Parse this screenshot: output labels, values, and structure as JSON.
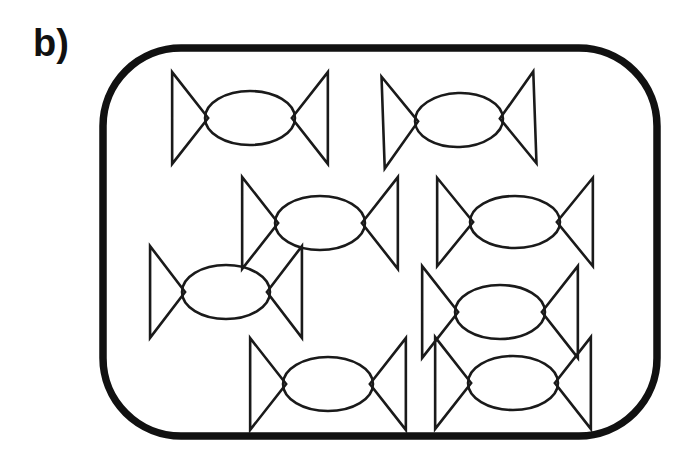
{
  "figure": {
    "panel_label": "b)",
    "background_color": "#ffffff",
    "ink_color": "#111111",
    "item_count": 8,
    "item_name": "candy",
    "container": {
      "name": "rounded-rectangle-enclosure",
      "x": 103,
      "y": 48,
      "width": 554,
      "height": 388,
      "corner_radius": 78,
      "stroke_width": 7.5,
      "stroke_color": "#111111",
      "fill_color": "#ffffff"
    }
  },
  "chart_data": {
    "type": "scatter",
    "title": "b)",
    "xlabel": "",
    "ylabel": "",
    "grid": false,
    "legend": null,
    "categories": [
      "candy"
    ],
    "series": [
      {
        "name": "candy",
        "count": 8,
        "points": [
          {
            "id": "candy-1",
            "row": 1,
            "col": 1,
            "cx": 250,
            "cy": 118,
            "rx": 45,
            "ry": 27,
            "wing": 36,
            "rotation": 0
          },
          {
            "id": "candy-2",
            "row": 1,
            "col": 2,
            "cx": 459,
            "cy": 120,
            "rx": 44,
            "ry": 27,
            "wing": 35,
            "rotation": -2
          },
          {
            "id": "candy-3",
            "row": 2,
            "col": 1,
            "cx": 320,
            "cy": 223,
            "rx": 45,
            "ry": 27,
            "wing": 36,
            "rotation": 0
          },
          {
            "id": "candy-4",
            "row": 2,
            "col": 2,
            "cx": 515,
            "cy": 222,
            "rx": 45,
            "ry": 26,
            "wing": 36,
            "rotation": 0
          },
          {
            "id": "candy-5",
            "row": 3,
            "col": 1,
            "cx": 226,
            "cy": 292,
            "rx": 44,
            "ry": 27,
            "wing": 35,
            "rotation": 0
          },
          {
            "id": "candy-6",
            "row": 3,
            "col": 2,
            "cx": 500,
            "cy": 312,
            "rx": 45,
            "ry": 27,
            "wing": 36,
            "rotation": 0
          },
          {
            "id": "candy-7",
            "row": 4,
            "col": 1,
            "cx": 328,
            "cy": 384,
            "rx": 45,
            "ry": 27,
            "wing": 36,
            "rotation": 0
          },
          {
            "id": "candy-8",
            "row": 4,
            "col": 2,
            "cx": 513,
            "cy": 383,
            "rx": 45,
            "ry": 27,
            "wing": 36,
            "rotation": 0
          }
        ]
      }
    ]
  }
}
